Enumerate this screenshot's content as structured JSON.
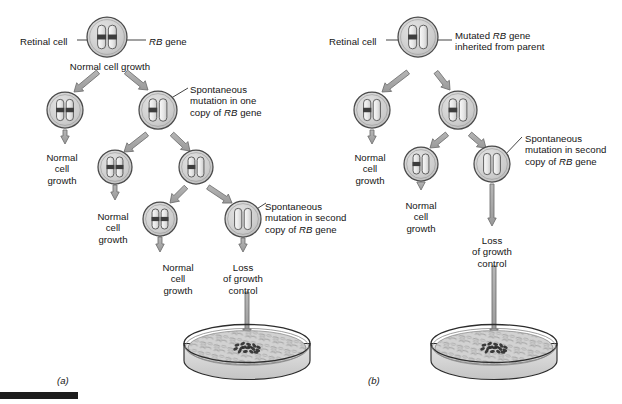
{
  "figure": {
    "title_alt": "Retinoblastoma RB gene two-hit mutation diagram",
    "background": "#ffffff",
    "colors": {
      "cell_fill": "#cfcfcf",
      "cell_stroke": "#4a4a4a",
      "chromosome_fill": "#e8e8e8",
      "chromosome_stroke": "#5a5a5a",
      "gene_band": "#3d3d3d",
      "arrow_fill": "#a8a8a8",
      "arrow_stroke": "#6e6e6e",
      "leader_line": "#3a3a3a",
      "dish_fill": "#d8d8d8",
      "dish_stroke": "#2c2c2c",
      "focus_cluster": "#2a2a2a",
      "text": "#141414",
      "rule_bar": "#1c1c1c"
    }
  },
  "panels": [
    {
      "id": "a",
      "label": "(a)",
      "label_x": 57,
      "label_y": 375,
      "caption_note": "Sporadic retinoblastoma: two independent somatic mutations required",
      "labels": [
        {
          "name": "retinal-cell-label",
          "text": "Retinal cell",
          "x": 20,
          "y": 36,
          "align": "lft"
        },
        {
          "name": "rb-gene-label",
          "text": "RB gene",
          "x": 149,
          "y": 36,
          "align": "lft",
          "italic_prefix": "RB"
        },
        {
          "name": "normal-growth-top",
          "text": "Normal cell growth",
          "x": 110,
          "y": 61,
          "align": "ctr"
        },
        {
          "name": "spontaneous-one",
          "text": "Spontaneous\nmutation in one\ncopy of RB gene",
          "x": 190,
          "y": 84,
          "align": "lft"
        },
        {
          "name": "normal-growth-left",
          "text": "Normal\ncell\ngrowth",
          "x": 62,
          "y": 152,
          "align": "ctr"
        },
        {
          "name": "normal-growth-mid",
          "text": "Normal\ncell\ngrowth",
          "x": 113,
          "y": 211,
          "align": "ctr"
        },
        {
          "name": "normal-growth-low",
          "text": "Normal\ncell\ngrowth",
          "x": 178,
          "y": 262,
          "align": "ctr"
        },
        {
          "name": "spontaneous-second",
          "text": "Spontaneous\nmutation in second\ncopy of RB gene",
          "x": 265,
          "y": 201,
          "align": "lft"
        },
        {
          "name": "loss-of-control",
          "text": "Loss\nof growth\ncontrol",
          "x": 243,
          "y": 262,
          "align": "ctr"
        }
      ],
      "cells": [
        {
          "name": "cell-parent",
          "cx": 107,
          "cy": 37,
          "r": 20,
          "mutations": 0
        },
        {
          "name": "cell-normal-branch",
          "cx": 65,
          "cy": 110,
          "r": 18,
          "mutations": 0
        },
        {
          "name": "cell-mutant-one",
          "cx": 158,
          "cy": 110,
          "r": 19,
          "mutations": 1
        },
        {
          "name": "cell-normal-mid",
          "cx": 115,
          "cy": 167,
          "r": 17,
          "mutations": 0
        },
        {
          "name": "cell-mutant-mid",
          "cx": 196,
          "cy": 167,
          "r": 17,
          "mutations": 1
        },
        {
          "name": "cell-normal-low",
          "cx": 160,
          "cy": 219,
          "r": 17,
          "mutations": 0
        },
        {
          "name": "cell-mutant-two",
          "cx": 243,
          "cy": 219,
          "r": 18,
          "mutations": 2
        }
      ],
      "dish": {
        "name": "petri-dish-a",
        "cx": 247,
        "cy": 352,
        "rx": 63,
        "ry": 19,
        "depth": 17
      }
    },
    {
      "id": "b",
      "label": "(b)",
      "label_x": 368,
      "label_y": 375,
      "caption_note": "Hereditary retinoblastoma: one mutation inherited, one somatic",
      "labels": [
        {
          "name": "retinal-cell-label",
          "text": "Retinal cell",
          "x": 329,
          "y": 36,
          "align": "lft"
        },
        {
          "name": "mutated-inherited",
          "text": "Mutated RB gene\ninherited from parent",
          "x": 455,
          "y": 30,
          "align": "lft"
        },
        {
          "name": "normal-growth-left",
          "text": "Normal\ncell\ngrowth",
          "x": 370,
          "y": 152,
          "align": "ctr"
        },
        {
          "name": "normal-growth-mid",
          "text": "Normal\ncell\ngrowth",
          "x": 421,
          "y": 200,
          "align": "ctr"
        },
        {
          "name": "spontaneous-second",
          "text": "Spontaneous\nmutation in second\ncopy of RB gene",
          "x": 525,
          "y": 133,
          "align": "lft"
        },
        {
          "name": "loss-of-control",
          "text": "Loss\nof growth\ncontrol",
          "x": 492,
          "y": 235,
          "align": "ctr"
        }
      ],
      "cells": [
        {
          "name": "cell-parent-mutant",
          "cx": 418,
          "cy": 37,
          "r": 20,
          "mutations": 1
        },
        {
          "name": "cell-left-mutant",
          "cx": 372,
          "cy": 110,
          "r": 18,
          "mutations": 1
        },
        {
          "name": "cell-right-mutant",
          "cx": 458,
          "cy": 110,
          "r": 19,
          "mutations": 1
        },
        {
          "name": "cell-mid-mutant",
          "cx": 421,
          "cy": 164,
          "r": 17,
          "mutations": 1
        },
        {
          "name": "cell-double-mutant",
          "cx": 492,
          "cy": 164,
          "r": 18,
          "mutations": 2
        }
      ],
      "dish": {
        "name": "petri-dish-b",
        "cx": 494,
        "cy": 352,
        "rx": 63,
        "ry": 19,
        "depth": 17
      }
    }
  ],
  "arrows": {
    "panel_a": [
      {
        "name": "arrow-parent-to-left",
        "x1": 98,
        "y1": 72,
        "x2": 74,
        "y2": 92,
        "thick": true
      },
      {
        "name": "arrow-parent-to-right",
        "x1": 126,
        "y1": 72,
        "x2": 148,
        "y2": 90,
        "thick": true
      },
      {
        "name": "arrow-left-down",
        "x1": 65,
        "y1": 130,
        "x2": 65,
        "y2": 144,
        "thick": false
      },
      {
        "name": "arrow-mutant-to-mid",
        "x1": 147,
        "y1": 134,
        "x2": 124,
        "y2": 152,
        "thick": true
      },
      {
        "name": "arrow-mutant-to-right",
        "x1": 172,
        "y1": 134,
        "x2": 190,
        "y2": 151,
        "thick": true
      },
      {
        "name": "arrow-mid-down",
        "x1": 115,
        "y1": 185,
        "x2": 115,
        "y2": 200,
        "thick": false
      },
      {
        "name": "arrow-mid2-to-low",
        "x1": 186,
        "y1": 187,
        "x2": 170,
        "y2": 203,
        "thick": true
      },
      {
        "name": "arrow-mid2-to-mutant2",
        "x1": 208,
        "y1": 187,
        "x2": 232,
        "y2": 203,
        "thick": true
      },
      {
        "name": "arrow-low-down",
        "x1": 160,
        "y1": 237,
        "x2": 160,
        "y2": 252,
        "thick": false
      },
      {
        "name": "arrow-mutant2-down",
        "x1": 243,
        "y1": 238,
        "x2": 243,
        "y2": 252,
        "thick": false
      },
      {
        "name": "arrow-to-dish",
        "x1": 247,
        "y1": 292,
        "x2": 247,
        "y2": 337,
        "thick": false
      }
    ],
    "panel_b": [
      {
        "name": "arrow-parent-to-left",
        "x1": 408,
        "y1": 72,
        "x2": 382,
        "y2": 92,
        "thick": true
      },
      {
        "name": "arrow-parent-to-right",
        "x1": 436,
        "y1": 72,
        "x2": 450,
        "y2": 90,
        "thick": true
      },
      {
        "name": "arrow-left-down",
        "x1": 372,
        "y1": 130,
        "x2": 372,
        "y2": 144,
        "thick": false
      },
      {
        "name": "arrow-right-to-mid",
        "x1": 447,
        "y1": 134,
        "x2": 430,
        "y2": 148,
        "thick": true
      },
      {
        "name": "arrow-right-to-double",
        "x1": 470,
        "y1": 134,
        "x2": 486,
        "y2": 148,
        "thick": true
      },
      {
        "name": "arrow-mid-down",
        "x1": 421,
        "y1": 182,
        "x2": 421,
        "y2": 190,
        "thick": false
      },
      {
        "name": "arrow-double-down",
        "x1": 492,
        "y1": 184,
        "x2": 492,
        "y2": 226,
        "thick": false
      },
      {
        "name": "arrow-to-dish",
        "x1": 494,
        "y1": 266,
        "x2": 494,
        "y2": 337,
        "thick": false
      }
    ]
  }
}
